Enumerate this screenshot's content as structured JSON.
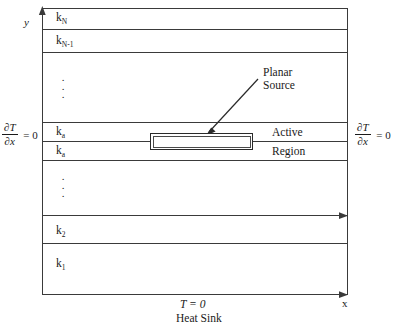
{
  "figure": {
    "type": "multilayer-heat-conduction-schematic",
    "axes": {
      "y_label": "y",
      "x_label": "x"
    },
    "layers": [
      {
        "id": "layer-kN",
        "label_html": "k<sub>N</sub>",
        "label": "kN"
      },
      {
        "id": "layer-kN1",
        "label_html": "k<sub>N-1</sub>",
        "label": "kN-1"
      },
      {
        "id": "layer-upper-ellipsis",
        "label": "···"
      },
      {
        "id": "layer-ka-upper",
        "label_html": "k<sub>a</sub>",
        "label": "ka"
      },
      {
        "id": "layer-ka-lower",
        "label_html": "k<sub>a</sub>",
        "label": "ka"
      },
      {
        "id": "layer-lower-ellipsis",
        "label": "···"
      },
      {
        "id": "layer-k2",
        "label_html": "k<sub>2</sub>",
        "label": "k2"
      },
      {
        "id": "layer-k1",
        "label_html": "k<sub>1</sub>",
        "label": "k1"
      }
    ],
    "annotations": {
      "planar_source_line1": "Planar",
      "planar_source_line2": "Source",
      "active": "Active",
      "region": "Region"
    },
    "boundary_conditions": {
      "left": {
        "numerator": "∂T",
        "denominator": "∂x",
        "equals": "= 0"
      },
      "right": {
        "numerator": "∂T",
        "denominator": "∂x",
        "equals": "= 0"
      }
    },
    "bottom": {
      "temperature": "T = 0",
      "heat_sink": "Heat Sink"
    },
    "colors": {
      "line": "#3a3a3a",
      "text": "#1a1a1a",
      "background": "#ffffff"
    }
  }
}
